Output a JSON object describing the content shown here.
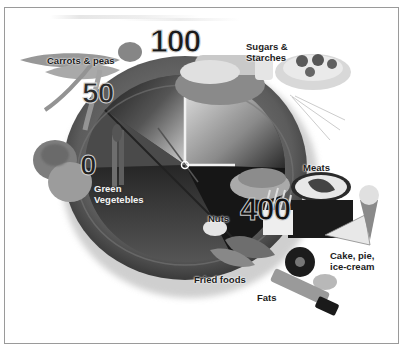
{
  "figure": {
    "title": ""
  },
  "dial": {
    "values": [
      "0",
      "50",
      "100",
      "400"
    ],
    "value_0": "0",
    "value_50": "50",
    "value_100": "100",
    "value_400": "400"
  },
  "labels": {
    "carrots_peas": "Carrots & peas",
    "sugars_line1": "Sugars &",
    "sugars_line2": "Starches",
    "green_line1": "Green",
    "green_line2": "Vegetebles",
    "meats": "Meats",
    "nuts": "Nuts",
    "cake_line1": "Cake, pie,",
    "cake_line2": "ice-cream",
    "fried_foods": "Fried foods",
    "fats": "Fats"
  },
  "colors": {
    "frame_border": "#9a9a9a",
    "background": "#ffffff",
    "plate_rim": "#5a5a5a",
    "plate_dark": "#1e1e1e",
    "clock_hands": "#f2f2f2"
  }
}
